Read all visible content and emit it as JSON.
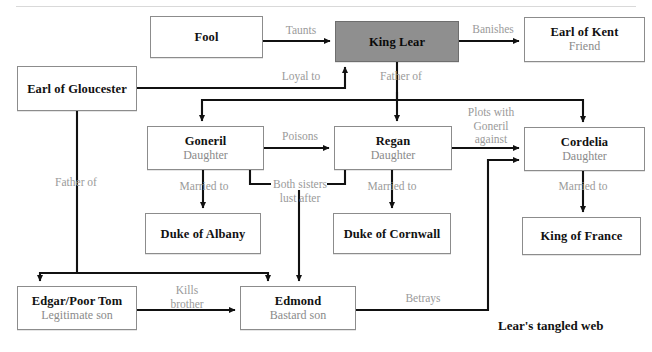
{
  "diagram": {
    "caption": "Lear's tangled web",
    "accent_fill": "#8f8f8f",
    "box_border": "#8c8c8c",
    "label_color": "#9a9a9a",
    "nodes": [
      {
        "id": "fool",
        "name": "Fool",
        "sub": "",
        "x": 150,
        "y": 16,
        "w": 113,
        "h": 42,
        "filled": false
      },
      {
        "id": "king-lear",
        "name": "King Lear",
        "sub": "",
        "x": 335,
        "y": 21,
        "w": 124,
        "h": 41,
        "filled": true
      },
      {
        "id": "kent",
        "name": "Earl of Kent",
        "sub": "Friend",
        "x": 524,
        "y": 17,
        "w": 121,
        "h": 45,
        "filled": false
      },
      {
        "id": "gloucester",
        "name": "Earl of Gloucester",
        "sub": "",
        "x": 17,
        "y": 66,
        "w": 120,
        "h": 45,
        "filled": false
      },
      {
        "id": "goneril",
        "name": "Goneril",
        "sub": "Daughter",
        "x": 147,
        "y": 126,
        "w": 117,
        "h": 44,
        "filled": false
      },
      {
        "id": "regan",
        "name": "Regan",
        "sub": "Daughter",
        "x": 334,
        "y": 126,
        "w": 118,
        "h": 44,
        "filled": false
      },
      {
        "id": "cordelia",
        "name": "Cordelia",
        "sub": "Daughter",
        "x": 524,
        "y": 127,
        "w": 121,
        "h": 44,
        "filled": false
      },
      {
        "id": "albany",
        "name": "Duke of Albany",
        "sub": "",
        "x": 145,
        "y": 213,
        "w": 116,
        "h": 41,
        "filled": false
      },
      {
        "id": "cornwall",
        "name": "Duke of Cornwall",
        "sub": "",
        "x": 333,
        "y": 213,
        "w": 118,
        "h": 41,
        "filled": false
      },
      {
        "id": "france",
        "name": "King of France",
        "sub": "",
        "x": 522,
        "y": 217,
        "w": 119,
        "h": 38,
        "filled": false
      },
      {
        "id": "edgar",
        "name": "Edgar/Poor Tom",
        "sub": "Legitimate son",
        "x": 17,
        "y": 286,
        "w": 120,
        "h": 44,
        "filled": false
      },
      {
        "id": "edmond",
        "name": "Edmond",
        "sub": "Bastard son",
        "x": 240,
        "y": 286,
        "w": 116,
        "h": 44,
        "filled": false
      }
    ],
    "edges": [
      {
        "id": "fool-lear",
        "from": "fool",
        "to": "king-lear",
        "label": "Taunts",
        "lx": 273,
        "ly": 24,
        "lw": 56
      },
      {
        "id": "lear-kent",
        "from": "king-lear",
        "to": "kent",
        "label": "Banishes",
        "lx": 462,
        "ly": 23,
        "lw": 62
      },
      {
        "id": "gloucester-lear",
        "from": "gloucester",
        "to": "king-lear",
        "label": "Loyal to",
        "lx": 272,
        "ly": 70,
        "lw": 58
      },
      {
        "id": "lear-daughters",
        "from": "king-lear",
        "to": "goneril, regan, cordelia",
        "label": "Father of",
        "lx": 370,
        "ly": 70,
        "lw": 62
      },
      {
        "id": "goneril-regan",
        "from": "goneril",
        "to": "regan",
        "label": "Poisons",
        "lx": 272,
        "ly": 130,
        "lw": 56
      },
      {
        "id": "regan-cordelia",
        "from": "regan",
        "to": "cordelia",
        "label": "Plots with Goneril against",
        "lx": 458,
        "ly": 106,
        "lw": 66
      },
      {
        "id": "goneril-albany",
        "from": "goneril",
        "to": "albany",
        "label": "Married to",
        "lx": 168,
        "ly": 180,
        "lw": 72
      },
      {
        "id": "regan-cornwall",
        "from": "regan",
        "to": "cornwall",
        "label": "Married to",
        "lx": 356,
        "ly": 180,
        "lw": 72
      },
      {
        "id": "cordelia-france",
        "from": "cordelia",
        "to": "france",
        "label": "Married to",
        "lx": 547,
        "ly": 180,
        "lw": 72
      },
      {
        "id": "sisters-edmond",
        "from": "goneril, regan",
        "to": "edmond",
        "label": "Both sisters lust after",
        "lx": 266,
        "ly": 181,
        "lw": 68
      },
      {
        "id": "gloucester-sons",
        "from": "gloucester",
        "to": "edgar, edmond",
        "label": "Father of",
        "lx": 45,
        "ly": 176,
        "lw": 62
      },
      {
        "id": "edgar-edmond",
        "from": "edgar",
        "to": "edmond",
        "label": "Kills brother",
        "lx": 160,
        "ly": 284,
        "lw": 54
      },
      {
        "id": "edmond-cordelia",
        "from": "edmond",
        "to": "cordelia",
        "label": "Betrays",
        "lx": 395,
        "ly": 292,
        "lw": 56
      }
    ]
  }
}
